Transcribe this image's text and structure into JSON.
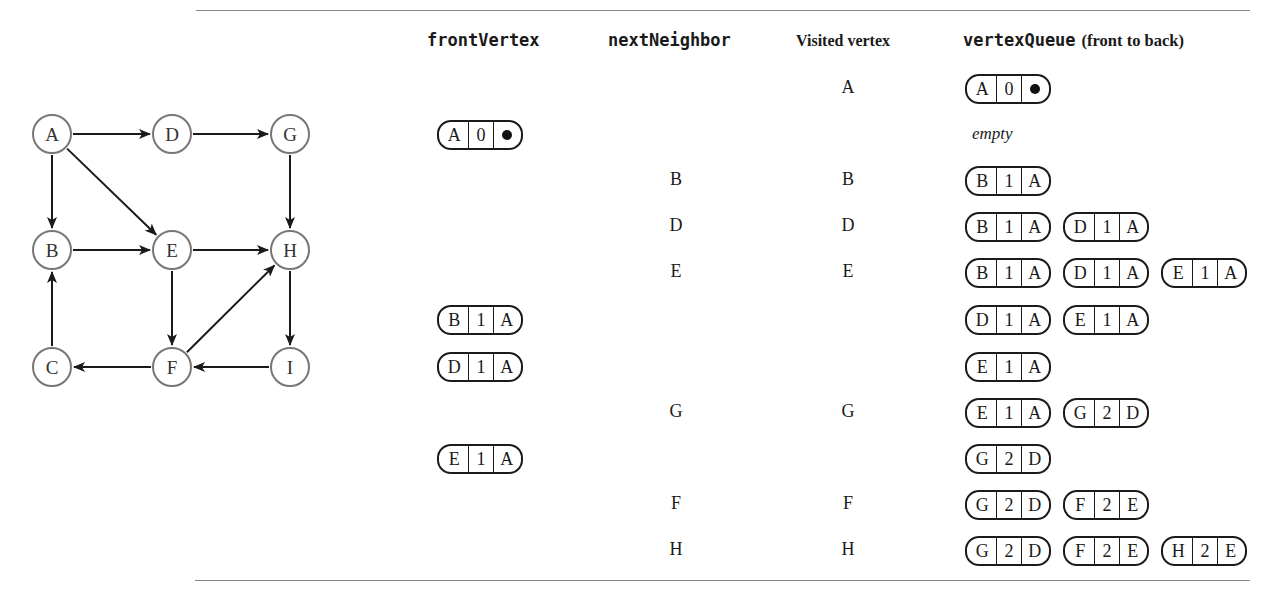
{
  "graph": {
    "nodes": [
      {
        "id": "A",
        "x": 52,
        "y": 44
      },
      {
        "id": "D",
        "x": 172,
        "y": 44
      },
      {
        "id": "G",
        "x": 290,
        "y": 44
      },
      {
        "id": "B",
        "x": 52,
        "y": 160
      },
      {
        "id": "E",
        "x": 172,
        "y": 160
      },
      {
        "id": "H",
        "x": 290,
        "y": 160
      },
      {
        "id": "C",
        "x": 52,
        "y": 277
      },
      {
        "id": "F",
        "x": 172,
        "y": 277
      },
      {
        "id": "I",
        "x": 290,
        "y": 277
      }
    ],
    "edges": [
      [
        "A",
        "D"
      ],
      [
        "D",
        "G"
      ],
      [
        "A",
        "B"
      ],
      [
        "A",
        "E"
      ],
      [
        "G",
        "H"
      ],
      [
        "B",
        "E"
      ],
      [
        "E",
        "H"
      ],
      [
        "E",
        "F"
      ],
      [
        "F",
        "H"
      ],
      [
        "H",
        "I"
      ],
      [
        "I",
        "F"
      ],
      [
        "F",
        "C"
      ],
      [
        "C",
        "B"
      ]
    ]
  },
  "table": {
    "headers": {
      "front_vertex": "frontVertex",
      "next_neighbor": "nextNeighbor",
      "visited_vertex": "Visited vertex",
      "vertex_queue": "vertexQueue",
      "vertex_queue_note": "(front to back)"
    },
    "empty_label": "empty",
    "rows": [
      {
        "front": null,
        "next": "",
        "visited": "A",
        "queue": [
          [
            "A",
            "0",
            "•"
          ]
        ]
      },
      {
        "front": [
          "A",
          "0",
          "•"
        ],
        "next": "",
        "visited": "",
        "queue": []
      },
      {
        "front": null,
        "next": "B",
        "visited": "B",
        "queue": [
          [
            "B",
            "1",
            "A"
          ]
        ]
      },
      {
        "front": null,
        "next": "D",
        "visited": "D",
        "queue": [
          [
            "B",
            "1",
            "A"
          ],
          [
            "D",
            "1",
            "A"
          ]
        ]
      },
      {
        "front": null,
        "next": "E",
        "visited": "E",
        "queue": [
          [
            "B",
            "1",
            "A"
          ],
          [
            "D",
            "1",
            "A"
          ],
          [
            "E",
            "1",
            "A"
          ]
        ]
      },
      {
        "front": [
          "B",
          "1",
          "A"
        ],
        "next": "",
        "visited": "",
        "queue": [
          [
            "D",
            "1",
            "A"
          ],
          [
            "E",
            "1",
            "A"
          ]
        ]
      },
      {
        "front": [
          "D",
          "1",
          "A"
        ],
        "next": "",
        "visited": "",
        "queue": [
          [
            "E",
            "1",
            "A"
          ]
        ]
      },
      {
        "front": null,
        "next": "G",
        "visited": "G",
        "queue": [
          [
            "E",
            "1",
            "A"
          ],
          [
            "G",
            "2",
            "D"
          ]
        ]
      },
      {
        "front": [
          "E",
          "1",
          "A"
        ],
        "next": "",
        "visited": "",
        "queue": [
          [
            "G",
            "2",
            "D"
          ]
        ]
      },
      {
        "front": null,
        "next": "F",
        "visited": "F",
        "queue": [
          [
            "G",
            "2",
            "D"
          ],
          [
            "F",
            "2",
            "E"
          ]
        ]
      },
      {
        "front": null,
        "next": "H",
        "visited": "H",
        "queue": [
          [
            "G",
            "2",
            "D"
          ],
          [
            "F",
            "2",
            "E"
          ],
          [
            "H",
            "2",
            "E"
          ]
        ]
      }
    ],
    "row_tops": [
      73,
      119,
      165,
      211,
      257,
      304,
      351,
      397,
      443,
      489,
      535
    ]
  },
  "colors": {
    "ink": "#1a1a1a",
    "node_stroke": "#777777",
    "rule": "#8a8a8a"
  }
}
